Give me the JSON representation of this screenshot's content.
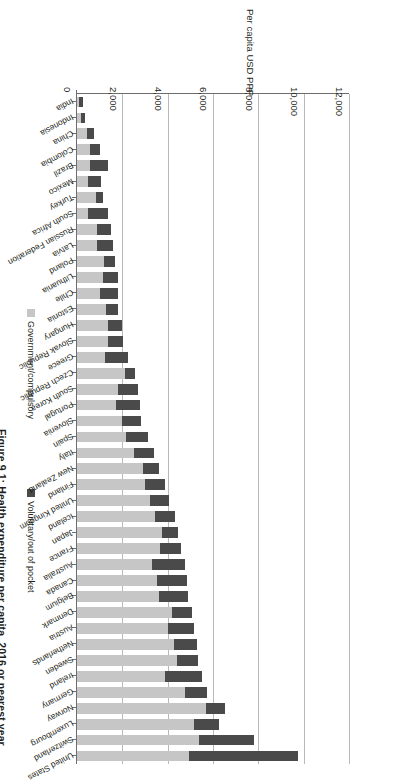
{
  "figure": {
    "title": "Figure 9.1: Health expenditure per capita, 2016 or nearest year"
  },
  "legend": {
    "position": "left",
    "items": [
      {
        "label": "Government/compulsory",
        "color": "#c6c6c6"
      },
      {
        "label": "Voluntary/out of pocket",
        "color": "#4a4a4a"
      }
    ]
  },
  "axis": {
    "x_title": "Per capita USD PPP",
    "ticks": [
      "0",
      "2,000",
      "4,000",
      "6,000",
      "8,000",
      "10,000",
      "12,000"
    ]
  },
  "chart_data": {
    "type": "bar",
    "orientation": "horizontal-stacked",
    "title": "Figure 9.1: Health expenditure per capita, 2016 or nearest year",
    "xlabel": "Per capita USD PPP",
    "ylabel": "",
    "xlim": [
      0,
      12000
    ],
    "xticks": [
      0,
      2000,
      4000,
      6000,
      8000,
      10000,
      12000
    ],
    "grid": true,
    "legend_position": "left",
    "categories": [
      "United States",
      "Switzerland",
      "Luxembourg",
      "Norway",
      "Germany",
      "Ireland",
      "Sweden",
      "Netherlands",
      "Austria",
      "Denmark",
      "Belgium",
      "Canada",
      "Australia",
      "France",
      "Japan",
      "Iceland",
      "United Kingdom",
      "Finland",
      "New Zealand",
      "Italy",
      "Spain",
      "Slovenia",
      "Portugal",
      "South Korea",
      "Czech Republic",
      "Greece",
      "Slovak Republic",
      "Hungary",
      "Estonia",
      "Chile",
      "Lithuania",
      "Poland",
      "Latvia",
      "Russian Federation",
      "South Africa",
      "Turkey",
      "Mexico",
      "Brazil",
      "Colombia",
      "China",
      "Indonesia",
      "India"
    ],
    "series": [
      {
        "name": "Government/compulsory",
        "color": "#c6c6c6",
        "values": [
          4950,
          5380,
          5150,
          5700,
          4750,
          3900,
          4420,
          4280,
          4000,
          4200,
          3600,
          3520,
          3300,
          3680,
          3750,
          3450,
          3220,
          3020,
          2900,
          2500,
          2150,
          2000,
          1700,
          1820,
          2100,
          1230,
          1380,
          1350,
          1280,
          1000,
          1150,
          1200,
          880,
          880,
          480,
          820,
          480,
          560,
          570,
          430,
          160,
          70
        ]
      },
      {
        "name": "Voluntary/out of pocket",
        "color": "#4a4a4a",
        "values": [
          4820,
          2420,
          1120,
          810,
          1000,
          1600,
          930,
          1000,
          1180,
          880,
          1320,
          1320,
          1450,
          920,
          690,
          860,
          860,
          870,
          720,
          880,
          1000,
          840,
          1080,
          880,
          440,
          1020,
          630,
          620,
          520,
          820,
          650,
          490,
          700,
          610,
          900,
          350,
          570,
          830,
          450,
          340,
          180,
          200
        ]
      }
    ]
  }
}
